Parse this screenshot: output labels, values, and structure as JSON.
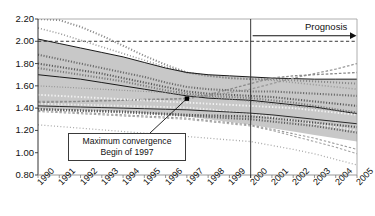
{
  "chart_data": {
    "type": "line",
    "title": "18 countries  1990–2005",
    "xlabel": "",
    "ylabel": "",
    "xlim": [
      1990,
      2005
    ],
    "ylim": [
      0.8,
      2.2
    ],
    "grid": false,
    "legend_position": "none",
    "x": [
      1990,
      1991,
      1992,
      1993,
      1994,
      1995,
      1996,
      1997,
      1998,
      1999,
      2000,
      2001,
      2002,
      2003,
      2004,
      2005
    ],
    "xtick_labels": [
      "1990",
      "1991",
      "1992",
      "1993",
      "1994",
      "1995",
      "1996",
      "1997",
      "1998",
      "1999",
      "2000",
      "2001",
      "2002",
      "2003",
      "2004",
      "2005"
    ],
    "ytick_labels": [
      "0.80",
      "1.00",
      "1.20",
      "1.40",
      "1.60",
      "1.80",
      "2.00",
      "2.20"
    ],
    "ytick_values": [
      0.8,
      1.0,
      1.2,
      1.4,
      1.6,
      1.8,
      2.0,
      2.2
    ],
    "reference_lines": [
      {
        "name": "upper-dashed-reference",
        "orientation": "horizontal",
        "value": 2.0,
        "style": "dashed"
      },
      {
        "name": "prognosis-divider",
        "orientation": "vertical",
        "value": 2000,
        "style": "solid"
      }
    ],
    "annotations": [
      {
        "name": "maximum-convergence",
        "text_lines": [
          "Maximum convergence",
          "Begin of 1997"
        ],
        "point_x": 1997.0,
        "point_y": 1.485
      },
      {
        "name": "prognosis-arrow",
        "text": "Prognosis",
        "from_x": 2000,
        "to_x": 2005,
        "at_y": 2.05
      }
    ],
    "band": {
      "name": "convergence-band",
      "fill": "#b9b9b9",
      "upper": [
        2.02,
        1.98,
        1.94,
        1.9,
        1.86,
        1.81,
        1.76,
        1.72,
        1.7,
        1.69,
        1.68,
        1.67,
        1.66,
        1.66,
        1.66,
        1.66
      ],
      "lower": [
        1.39,
        1.385,
        1.38,
        1.375,
        1.37,
        1.355,
        1.34,
        1.325,
        1.3,
        1.275,
        1.25,
        1.22,
        1.19,
        1.16,
        1.13,
        1.1
      ]
    },
    "series": [
      {
        "name": "country-01",
        "style": "dotted-square",
        "color": "#8a8a8a",
        "values": [
          2.2,
          2.19,
          2.13,
          2.05,
          1.96,
          1.87,
          1.79,
          1.72,
          1.69,
          1.67,
          1.66,
          1.66,
          1.65,
          1.64,
          1.63,
          1.62
        ]
      },
      {
        "name": "country-02",
        "style": "dotted-cross",
        "color": "#9a9a9a",
        "values": [
          2.12,
          2.07,
          2.01,
          1.95,
          1.89,
          1.83,
          1.77,
          1.72,
          1.69,
          1.67,
          1.66,
          1.65,
          1.63,
          1.61,
          1.59,
          1.57
        ]
      },
      {
        "name": "country-03",
        "style": "solid-thin",
        "color": "#1a1a1a",
        "values": [
          2.02,
          1.98,
          1.94,
          1.9,
          1.86,
          1.81,
          1.76,
          1.72,
          1.7,
          1.69,
          1.68,
          1.67,
          1.665,
          1.66,
          1.66,
          1.66
        ]
      },
      {
        "name": "country-04",
        "style": "dotted-square-dark",
        "color": "#6a6a6a",
        "values": [
          1.88,
          1.84,
          1.8,
          1.76,
          1.72,
          1.68,
          1.63,
          1.59,
          1.57,
          1.56,
          1.55,
          1.55,
          1.54,
          1.53,
          1.52,
          1.51
        ]
      },
      {
        "name": "country-05",
        "style": "dotted-square-dark",
        "color": "#5a5a5a",
        "values": [
          1.8,
          1.77,
          1.74,
          1.71,
          1.67,
          1.63,
          1.59,
          1.55,
          1.53,
          1.52,
          1.51,
          1.5,
          1.48,
          1.46,
          1.44,
          1.42
        ]
      },
      {
        "name": "country-06",
        "style": "dotted-square-dark",
        "color": "#7a7a7a",
        "values": [
          1.76,
          1.73,
          1.7,
          1.67,
          1.64,
          1.6,
          1.56,
          1.53,
          1.51,
          1.5,
          1.49,
          1.47,
          1.45,
          1.42,
          1.39,
          1.36
        ]
      },
      {
        "name": "country-07",
        "style": "solid-thin",
        "color": "#1a1a1a",
        "values": [
          1.7,
          1.68,
          1.66,
          1.63,
          1.6,
          1.57,
          1.54,
          1.51,
          1.49,
          1.48,
          1.47,
          1.45,
          1.43,
          1.41,
          1.38,
          1.35
        ]
      },
      {
        "name": "country-08",
        "style": "dotted-fine",
        "color": "#8f8f8f",
        "values": [
          1.6,
          1.59,
          1.58,
          1.57,
          1.56,
          1.55,
          1.54,
          1.52,
          1.5,
          1.48,
          1.46,
          1.44,
          1.42,
          1.4,
          1.38,
          1.36
        ]
      },
      {
        "name": "country-09",
        "style": "dashed-cross",
        "color": "#9a9a9a",
        "values": [
          1.46,
          1.46,
          1.46,
          1.47,
          1.47,
          1.48,
          1.48,
          1.49,
          1.51,
          1.54,
          1.57,
          1.62,
          1.67,
          1.71,
          1.75,
          1.8
        ]
      },
      {
        "name": "country-10",
        "style": "dashed-cross",
        "color": "#8a8a8a",
        "values": [
          1.45,
          1.455,
          1.46,
          1.465,
          1.47,
          1.475,
          1.48,
          1.485,
          1.52,
          1.57,
          1.62,
          1.67,
          1.69,
          1.7,
          1.71,
          1.72
        ]
      },
      {
        "name": "country-11",
        "style": "white-dotted",
        "color": "#f2f2f2",
        "values": [
          1.52,
          1.51,
          1.5,
          1.49,
          1.48,
          1.47,
          1.46,
          1.45,
          1.44,
          1.43,
          1.42,
          1.41,
          1.4,
          1.38,
          1.36,
          1.34
        ]
      },
      {
        "name": "country-12",
        "style": "white-dotted",
        "color": "#ededed",
        "values": [
          1.44,
          1.435,
          1.43,
          1.425,
          1.42,
          1.415,
          1.41,
          1.405,
          1.39,
          1.37,
          1.35,
          1.32,
          1.29,
          1.26,
          1.23,
          1.2
        ]
      },
      {
        "name": "country-13",
        "style": "solid-thin",
        "color": "#2a2a2a",
        "values": [
          1.42,
          1.415,
          1.41,
          1.405,
          1.4,
          1.395,
          1.39,
          1.385,
          1.375,
          1.365,
          1.355,
          1.34,
          1.32,
          1.3,
          1.28,
          1.26
        ]
      },
      {
        "name": "country-14",
        "style": "dotted-square-dark",
        "color": "#4a4a4a",
        "values": [
          1.39,
          1.385,
          1.38,
          1.375,
          1.37,
          1.36,
          1.35,
          1.34,
          1.335,
          1.33,
          1.325,
          1.31,
          1.29,
          1.27,
          1.25,
          1.23
        ]
      },
      {
        "name": "country-15",
        "style": "dotted-square-dark",
        "color": "#5f5f5f",
        "values": [
          1.39,
          1.383,
          1.376,
          1.369,
          1.362,
          1.352,
          1.342,
          1.332,
          1.322,
          1.31,
          1.3,
          1.28,
          1.26,
          1.24,
          1.21,
          1.18
        ]
      },
      {
        "name": "country-16",
        "style": "dashed-fine",
        "color": "#9a9a9a",
        "values": [
          1.38,
          1.37,
          1.36,
          1.35,
          1.34,
          1.33,
          1.32,
          1.31,
          1.29,
          1.27,
          1.25,
          1.21,
          1.17,
          1.13,
          1.08,
          1.03
        ]
      },
      {
        "name": "country-17",
        "style": "dashed-fine",
        "color": "#a5a5a5",
        "values": [
          1.37,
          1.36,
          1.35,
          1.34,
          1.33,
          1.32,
          1.31,
          1.3,
          1.28,
          1.26,
          1.24,
          1.2,
          1.15,
          1.1,
          1.05,
          0.99
        ]
      },
      {
        "name": "country-18",
        "style": "dotted-cross-light",
        "color": "#a8a8a8",
        "values": [
          1.25,
          1.235,
          1.22,
          1.205,
          1.19,
          1.175,
          1.16,
          1.145,
          1.13,
          1.115,
          1.1,
          1.065,
          1.03,
          0.99,
          0.94,
          0.89
        ]
      }
    ]
  }
}
